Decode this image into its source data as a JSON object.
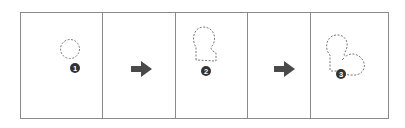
{
  "diagram": {
    "panels": [
      {
        "type": "step",
        "step_number": "1",
        "shape": "dashed-circle"
      },
      {
        "type": "arrow",
        "direction": "right"
      },
      {
        "type": "step",
        "step_number": "2",
        "shape": "dashed-keyhole"
      },
      {
        "type": "arrow",
        "direction": "right"
      },
      {
        "type": "step",
        "step_number": "3",
        "shape": "dashed-heart"
      }
    ],
    "colors": {
      "border": "#8a8a8a",
      "dashed_outline": "#777777",
      "arrow": "#4a4a4a",
      "badge": "#333333",
      "badge_text": "#ffffff"
    }
  }
}
